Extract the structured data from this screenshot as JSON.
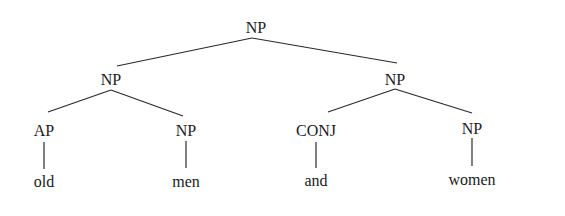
{
  "tree": {
    "root": {
      "label": "NP"
    },
    "left": {
      "label": "NP"
    },
    "right": {
      "label": "NP"
    },
    "ap": {
      "label": "AP"
    },
    "np_men": {
      "label": "NP"
    },
    "conj": {
      "label": "CONJ"
    },
    "np_women": {
      "label": "NP"
    },
    "leaves": {
      "old": "old",
      "men": "men",
      "and": "and",
      "women": "women"
    }
  }
}
